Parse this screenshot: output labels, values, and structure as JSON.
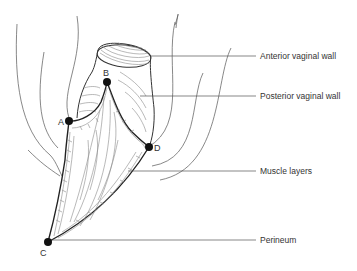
{
  "figure": {
    "labels": [
      {
        "id": "anterior-vaginal-wall",
        "text": "Anterior vaginal wall"
      },
      {
        "id": "posterior-vaginal-wall",
        "text": "Posterior vaginal wall"
      },
      {
        "id": "muscle-layers",
        "text": "Muscle layers"
      },
      {
        "id": "perineum",
        "text": "Perineum"
      }
    ],
    "points": [
      {
        "id": "A",
        "text": "A"
      },
      {
        "id": "B",
        "text": "B"
      },
      {
        "id": "C",
        "text": "C"
      },
      {
        "id": "D",
        "text": "D"
      }
    ]
  },
  "colors": {
    "line": "#333333",
    "point": "#111111",
    "text": "#333333",
    "background": "#ffffff"
  }
}
